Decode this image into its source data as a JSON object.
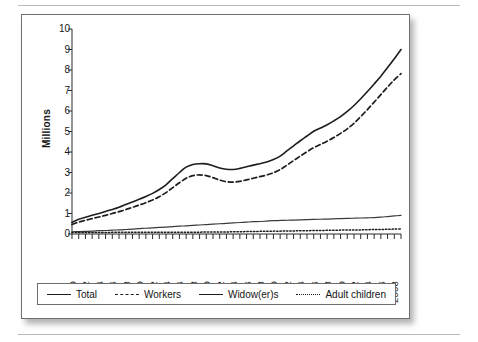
{
  "figure": {
    "y_axis_title": "Millions"
  },
  "legend": {
    "items": [
      {
        "label": "Total",
        "style": "solid"
      },
      {
        "label": "Workers",
        "style": "dashed"
      },
      {
        "label": "Widow(er)s",
        "style": "solid-thin"
      },
      {
        "label": "Adult children",
        "style": "dotted"
      }
    ]
  },
  "chart_data": {
    "type": "line",
    "title": "",
    "xlabel": "",
    "ylabel": "Millions",
    "ylim": [
      0,
      10
    ],
    "xlim": [
      1960,
      2009
    ],
    "grid": false,
    "legend_position": "bottom",
    "ytick_labels": [
      "0",
      "1",
      "2",
      "3",
      "4",
      "5",
      "6",
      "7",
      "8",
      "9",
      "10"
    ],
    "ytick_values": [
      0,
      1,
      2,
      3,
      4,
      5,
      6,
      7,
      8,
      9,
      10
    ],
    "xtick_labels": [
      "1960",
      "1962",
      "1964",
      "1966",
      "1968",
      "1970",
      "1972",
      "1974",
      "1976",
      "1978",
      "1980",
      "1982",
      "1984",
      "1986",
      "1988",
      "1990",
      "1992",
      "1994",
      "1996",
      "1998",
      "2000",
      "2002",
      "2004",
      "2006",
      "2008"
    ],
    "xtick_values": [
      1960,
      1962,
      1964,
      1966,
      1968,
      1970,
      1972,
      1974,
      1976,
      1978,
      1980,
      1982,
      1984,
      1986,
      1988,
      1990,
      1992,
      1994,
      1996,
      1998,
      2000,
      2002,
      2004,
      2006,
      2008
    ],
    "x": [
      1960,
      1961,
      1962,
      1963,
      1964,
      1965,
      1966,
      1967,
      1968,
      1969,
      1970,
      1971,
      1972,
      1973,
      1974,
      1975,
      1976,
      1977,
      1978,
      1979,
      1980,
      1981,
      1982,
      1983,
      1984,
      1985,
      1986,
      1987,
      1988,
      1989,
      1990,
      1991,
      1992,
      1993,
      1994,
      1995,
      1996,
      1997,
      1998,
      1999,
      2000,
      2001,
      2002,
      2003,
      2004,
      2005,
      2006,
      2007,
      2008,
      2009
    ],
    "series": [
      {
        "name": "Total",
        "style": "solid",
        "color": "#1d1d1d",
        "values": [
          0.57,
          0.72,
          0.82,
          0.91,
          1.0,
          1.1,
          1.2,
          1.31,
          1.44,
          1.56,
          1.69,
          1.83,
          1.98,
          2.17,
          2.4,
          2.7,
          3.0,
          3.26,
          3.39,
          3.43,
          3.42,
          3.33,
          3.22,
          3.16,
          3.15,
          3.2,
          3.28,
          3.36,
          3.43,
          3.51,
          3.63,
          3.8,
          4.05,
          4.3,
          4.55,
          4.78,
          5.01,
          5.17,
          5.33,
          5.52,
          5.73,
          5.98,
          6.27,
          6.6,
          6.95,
          7.32,
          7.7,
          8.12,
          8.55,
          9.0
        ]
      },
      {
        "name": "Workers",
        "style": "dashed",
        "color": "#1d1d1d",
        "values": [
          0.46,
          0.58,
          0.67,
          0.75,
          0.83,
          0.91,
          1.0,
          1.09,
          1.19,
          1.3,
          1.41,
          1.53,
          1.66,
          1.82,
          2.02,
          2.26,
          2.5,
          2.72,
          2.85,
          2.88,
          2.85,
          2.75,
          2.63,
          2.55,
          2.53,
          2.57,
          2.64,
          2.72,
          2.8,
          2.88,
          2.99,
          3.14,
          3.36,
          3.58,
          3.8,
          4.01,
          4.21,
          4.37,
          4.53,
          4.71,
          4.91,
          5.13,
          5.4,
          5.73,
          6.07,
          6.43,
          6.8,
          7.17,
          7.52,
          7.82
        ]
      },
      {
        "name": "Widow(er)s",
        "style": "solid-thin",
        "color": "#3a3a3a",
        "values": [
          0.11,
          0.12,
          0.13,
          0.14,
          0.16,
          0.17,
          0.19,
          0.2,
          0.22,
          0.24,
          0.26,
          0.28,
          0.3,
          0.32,
          0.34,
          0.36,
          0.38,
          0.4,
          0.42,
          0.44,
          0.46,
          0.48,
          0.5,
          0.52,
          0.54,
          0.56,
          0.58,
          0.6,
          0.61,
          0.63,
          0.65,
          0.66,
          0.67,
          0.68,
          0.69,
          0.7,
          0.71,
          0.72,
          0.73,
          0.74,
          0.75,
          0.76,
          0.77,
          0.78,
          0.79,
          0.8,
          0.82,
          0.85,
          0.88,
          0.91
        ]
      },
      {
        "name": "Adult children",
        "style": "dotted",
        "color": "#1d1d1d",
        "values": [
          0.07,
          0.07,
          0.07,
          0.07,
          0.07,
          0.07,
          0.08,
          0.08,
          0.08,
          0.08,
          0.08,
          0.08,
          0.08,
          0.08,
          0.09,
          0.09,
          0.09,
          0.09,
          0.09,
          0.09,
          0.1,
          0.1,
          0.1,
          0.1,
          0.11,
          0.11,
          0.12,
          0.12,
          0.13,
          0.13,
          0.14,
          0.14,
          0.15,
          0.15,
          0.16,
          0.16,
          0.17,
          0.17,
          0.18,
          0.18,
          0.19,
          0.19,
          0.2,
          0.2,
          0.21,
          0.22,
          0.22,
          0.23,
          0.24,
          0.25
        ]
      }
    ]
  }
}
